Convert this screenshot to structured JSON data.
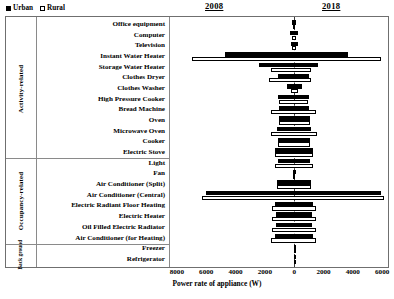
{
  "legend": {
    "items": [
      {
        "label": "Urban",
        "swatch": "filled-square",
        "color": "#000000"
      },
      {
        "label": "Rural",
        "swatch": "open-square",
        "color": "#ffffff"
      }
    ]
  },
  "headers": {
    "left_year": "2008",
    "right_year": "2018"
  },
  "axis": {
    "title": "Power rate of appliance (W)",
    "ticks": [
      "8000",
      "6000",
      "4000",
      "2000",
      "0",
      "2000",
      "4000",
      "6000"
    ],
    "tick_values": [
      -8000,
      -6000,
      -4000,
      -2000,
      0,
      2000,
      4000,
      6000
    ],
    "min": -8400,
    "max": 6400
  },
  "groups": [
    {
      "name": "Activity-related",
      "rows": 13
    },
    {
      "name": "Occupancy-related",
      "rows": 7
    },
    {
      "name": "Back ground",
      "rows": 2
    }
  ],
  "chart_data": {
    "type": "bar",
    "title": "",
    "subtitle": "",
    "xlabel": "Power rate of appliance (W)",
    "ylabel": "",
    "orientation": "horizontal",
    "layout": "diverging butterfly (2008 to the left of zero, 2018 to the right)",
    "grid": false,
    "legend_position": "top-left",
    "xlim": [
      -8400,
      6400
    ],
    "xticks": [
      -8000,
      -6000,
      -4000,
      -2000,
      0,
      2000,
      4000,
      6000
    ],
    "xticklabels": [
      "8000",
      "6000",
      "4000",
      "2000",
      "0",
      "2000",
      "4000",
      "6000"
    ],
    "panels": [
      "2008",
      "2018"
    ],
    "series": [
      {
        "name": "Urban",
        "style": "filled-black"
      },
      {
        "name": "Rural",
        "style": "open-white"
      }
    ],
    "categories": [
      "Office equipment",
      "Computer",
      "Television",
      "Instant Water Heater",
      "Storage Water Heater",
      "Clothes Dryer",
      "Clothes Washer",
      "High Pressure Cooker",
      "Bread Machine",
      "Oven",
      "Microwave Oven",
      "Cooker",
      "Electric Stove",
      "Light",
      "Fan",
      "Air Conditioner (Split)",
      "Air Conditioner (Central)",
      "Electric Radiant Floor Heating",
      "Electric Heater",
      "Oil Filled Electric Radiator",
      "Air Conditioner (for Heating)",
      "Freezer",
      "Refrigerator"
    ],
    "groups": [
      {
        "name": "Activity-related",
        "categories": [
          "Office equipment",
          "Computer",
          "Television",
          "Instant Water Heater",
          "Storage Water Heater",
          "Clothes Dryer",
          "Clothes Washer",
          "High Pressure Cooker",
          "Bread Machine",
          "Oven",
          "Microwave Oven",
          "Cooker",
          "Electric Stove"
        ]
      },
      {
        "name": "Occupancy-related",
        "categories": [
          "Light",
          "Fan",
          "Air Conditioner (Split)",
          "Air Conditioner (Central)",
          "Electric Radiant Floor Heating",
          "Electric Heater",
          "Oil Filled Electric Radiator",
          "Air Conditioner (for Heating)"
        ]
      },
      {
        "name": "Back ground",
        "categories": [
          "Freezer",
          "Refrigerator"
        ]
      }
    ],
    "rows": [
      {
        "category": "Office equipment",
        "urban_2008": 120,
        "urban_2018": 130,
        "rural_2008": 60,
        "rural_2018": 70
      },
      {
        "category": "Computer",
        "urban_2008": 260,
        "urban_2018": 270,
        "rural_2008": 150,
        "rural_2018": 160
      },
      {
        "category": "Television",
        "urban_2008": 230,
        "urban_2018": 240,
        "rural_2008": 150,
        "rural_2018": 150
      },
      {
        "category": "Instant Water Heater",
        "urban_2008": 4700,
        "urban_2018": 3650,
        "rural_2008": 6950,
        "rural_2018": 5900
      },
      {
        "category": "Storage Water Heater",
        "urban_2008": 2400,
        "urban_2018": 1620,
        "rural_2008": 1550,
        "rural_2018": 1180
      },
      {
        "category": "Clothes Dryer",
        "urban_2008": 1080,
        "urban_2018": 1000,
        "rural_2008": 1700,
        "rural_2018": 1150
      },
      {
        "category": "Clothes Washer",
        "urban_2008": 520,
        "urban_2018": 530,
        "rural_2008": 230,
        "rural_2018": 250
      },
      {
        "category": "High Pressure Cooker",
        "urban_2008": 1100,
        "urban_2018": 1000,
        "rural_2008": 1020,
        "rural_2018": 960
      },
      {
        "category": "Bread Machine",
        "urban_2008": 1020,
        "urban_2018": 1030,
        "rural_2008": 1550,
        "rural_2018": 1500
      },
      {
        "category": "Oven",
        "urban_2008": 1050,
        "urban_2018": 1060,
        "rural_2008": 1050,
        "rural_2018": 1060
      },
      {
        "category": "Microwave Oven",
        "urban_2008": 1160,
        "urban_2018": 1150,
        "rural_2008": 1600,
        "rural_2018": 1560
      },
      {
        "category": "Cooker",
        "urban_2008": 1080,
        "urban_2018": 1050,
        "rural_2008": 1120,
        "rural_2018": 1100
      },
      {
        "category": "Electric Stove",
        "urban_2008": 1300,
        "urban_2018": 1280,
        "rural_2008": 1320,
        "rural_2018": 1300
      },
      {
        "category": "Light",
        "urban_2008": 1100,
        "urban_2018": 1080,
        "rural_2008": 1300,
        "rural_2018": 1260
      },
      {
        "category": "Fan",
        "urban_2008": 100,
        "urban_2018": 110,
        "rural_2008": 70,
        "rural_2018": 80
      },
      {
        "category": "Air Conditioner (Split)",
        "urban_2008": 1180,
        "urban_2018": 1150,
        "rural_2008": 1180,
        "rural_2018": 1150
      },
      {
        "category": "Air Conditioner (Central)",
        "urban_2008": 6000,
        "urban_2018": 5900,
        "rural_2008": 6300,
        "rural_2018": 6100
      },
      {
        "category": "Electric Radiant Floor Heating",
        "urban_2008": 1320,
        "urban_2018": 1300,
        "rural_2008": 1520,
        "rural_2018": 1500
      },
      {
        "category": "Electric Heater",
        "urban_2008": 1250,
        "urban_2018": 1230,
        "rural_2008": 1500,
        "rural_2018": 1480
      },
      {
        "category": "Oil Filled Electric Radiator",
        "urban_2008": 1250,
        "urban_2018": 1240,
        "rural_2008": 1500,
        "rural_2018": 1470
      },
      {
        "category": "Air Conditioner (for Heating)",
        "urban_2008": 1330,
        "urban_2018": 1300,
        "rural_2008": 1550,
        "rural_2018": 1520
      },
      {
        "category": "Freezer",
        "urban_2008": 0,
        "urban_2018": 0,
        "rural_2008": 0,
        "rural_2018": 0
      },
      {
        "category": "Refrigerator",
        "urban_2008": 0,
        "urban_2018": 0,
        "rural_2008": 0,
        "rural_2018": 0
      }
    ]
  }
}
